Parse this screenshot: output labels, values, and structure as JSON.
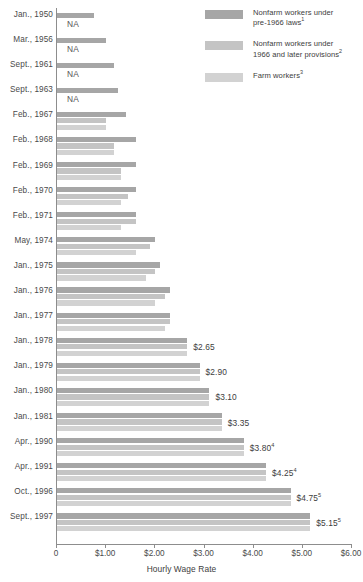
{
  "legend": {
    "items": [
      {
        "label_line1": "Nonfarm workers under",
        "label_line2": "pre-1966 laws",
        "sup": "1",
        "color": "#a6a6a6",
        "name": "nonfarm-pre-1966"
      },
      {
        "label_line1": "Nonfarm workers under",
        "label_line2": "1966 and later provisions",
        "sup": "2",
        "color": "#c4c4c4",
        "name": "nonfarm-1966-later"
      },
      {
        "label_line1": "Farm workers",
        "label_line2": "",
        "sup": "3",
        "color": "#d2d2d2",
        "name": "farm-workers"
      }
    ]
  },
  "axis": {
    "title": "Hourly Wage Rate",
    "ticks": [
      "0",
      "$1.00",
      "$2.00",
      "$3.00",
      "$4.00",
      "$5.00",
      "$6.00"
    ],
    "min": 0,
    "max": 6
  },
  "chart_data": {
    "type": "bar",
    "orientation": "horizontal",
    "title": "",
    "xlabel": "Hourly Wage Rate",
    "ylabel": "",
    "xlim": [
      0,
      6
    ],
    "grid": false,
    "legend_position": "top-right",
    "categories": [
      "Jan., 1950",
      "Mar., 1956",
      "Sept., 1961",
      "Sept., 1963",
      "Feb., 1967",
      "Feb., 1968",
      "Feb., 1969",
      "Feb., 1970",
      "Feb., 1971",
      "May, 1974",
      "Jan., 1975",
      "Jan., 1976",
      "Jan., 1977",
      "Jan., 1978",
      "Jan., 1979",
      "Jan., 1980",
      "Jan., 1981",
      "Apr., 1990",
      "Apr., 1991",
      "Oct., 1996",
      "Sept., 1997"
    ],
    "series": [
      {
        "name": "Nonfarm workers under pre-1966 laws",
        "color": "#a6a6a6",
        "values": [
          0.75,
          1.0,
          1.15,
          1.25,
          1.4,
          1.6,
          1.6,
          1.6,
          1.6,
          2.0,
          2.1,
          2.3,
          2.3,
          2.65,
          2.9,
          3.1,
          3.35,
          3.8,
          4.25,
          4.75,
          5.15
        ]
      },
      {
        "name": "Nonfarm workers under 1966 and later provisions",
        "color": "#c4c4c4",
        "values": [
          null,
          null,
          null,
          null,
          1.0,
          1.15,
          1.3,
          1.45,
          1.6,
          1.9,
          2.0,
          2.2,
          2.3,
          2.65,
          2.9,
          3.1,
          3.35,
          3.8,
          4.25,
          4.75,
          5.15
        ]
      },
      {
        "name": "Farm workers",
        "color": "#d2d2d2",
        "values": [
          null,
          null,
          null,
          null,
          1.0,
          1.15,
          1.3,
          1.3,
          1.3,
          1.6,
          1.8,
          2.0,
          2.2,
          2.65,
          2.9,
          3.1,
          3.35,
          3.8,
          4.25,
          4.75,
          5.15
        ]
      }
    ],
    "na_rows": [
      "Jan., 1950",
      "Mar., 1956",
      "Sept., 1961",
      "Sept., 1963"
    ],
    "na_text": "NA",
    "value_labels": [
      {
        "category": "Jan., 1978",
        "text": "$2.65",
        "sup": ""
      },
      {
        "category": "Jan., 1979",
        "text": "$2.90",
        "sup": ""
      },
      {
        "category": "Jan., 1980",
        "text": "$3.10",
        "sup": ""
      },
      {
        "category": "Jan., 1981",
        "text": "$3.35",
        "sup": ""
      },
      {
        "category": "Apr., 1990",
        "text": "$3.80",
        "sup": "4"
      },
      {
        "category": "Apr., 1991",
        "text": "$4.25",
        "sup": "4"
      },
      {
        "category": "Oct., 1996",
        "text": "$4.75",
        "sup": "5"
      },
      {
        "category": "Sept., 1997",
        "text": "$5.15",
        "sup": "5"
      }
    ]
  }
}
